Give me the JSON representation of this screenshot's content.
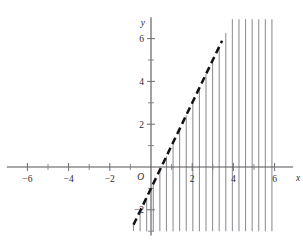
{
  "chart_data": {
    "type": "line",
    "title": "",
    "xlabel": "x",
    "ylabel": "y",
    "xlim": [
      -7.0,
      6.9
    ],
    "ylim": [
      -3.2,
      7.0
    ],
    "grid": false,
    "legend": null,
    "origin_label": "O",
    "x_ticks_major": [
      -6,
      -4,
      -2,
      2,
      4,
      6
    ],
    "x_tick_labels": [
      "−6",
      "−4",
      "−2",
      "2",
      "4",
      "6"
    ],
    "x_ticks_minor": [
      -5,
      -3,
      -1,
      1,
      3,
      5
    ],
    "y_ticks_major": [
      -2,
      2,
      4,
      6
    ],
    "y_tick_labels": [
      "−2",
      "2",
      "4",
      "6"
    ],
    "y_ticks_minor": [
      -3,
      -1,
      1,
      3,
      5
    ],
    "series": [
      {
        "name": "boundary",
        "style": "dashed",
        "color": "#111114",
        "equation": "y = 2x - 1",
        "slope": 2,
        "intercept": -1,
        "x_start": -0.85,
        "x_end": 3.45,
        "points": [
          [
            -0.85,
            -2.7
          ],
          [
            3.45,
            5.9
          ]
        ]
      }
    ],
    "shading": {
      "style": "vertical-hatch",
      "color": "#8d8d93",
      "description": "region to the right of the dashed line",
      "x_from": -0.85,
      "x_to": 6.0,
      "y_top": 6.9,
      "y_bottom": -3.0,
      "line_spacing_data_units": 0.32
    }
  },
  "axes": {
    "x_axis_label": "x",
    "y_axis_label": "y",
    "origin": "O"
  }
}
